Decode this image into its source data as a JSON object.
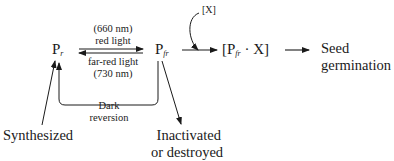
{
  "diagram": {
    "nodes": {
      "pr": {
        "base": "P",
        "sub": "r"
      },
      "pfr": {
        "base": "P",
        "sub": "fr"
      },
      "complex": {
        "open": "[P",
        "sub": "fr",
        "close": " · X]"
      },
      "x_reagent": "[X]",
      "seed": {
        "line1": "Seed",
        "line2": "germination"
      },
      "synthesized": "Synthesized",
      "inactivated": {
        "line1": "Inactivated",
        "line2": "or destroyed"
      }
    },
    "edges": {
      "red_light": {
        "line1": "(660 nm)",
        "line2": "red light"
      },
      "far_red_light": {
        "line1": "far-red light",
        "line2": "(730 nm)"
      },
      "dark_reversion": {
        "line1": "Dark",
        "line2": "reversion"
      }
    },
    "colors": {
      "ink": "#1a1a1a",
      "background": "#ffffff"
    }
  }
}
